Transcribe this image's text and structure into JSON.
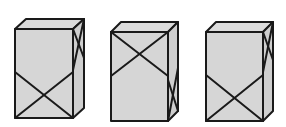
{
  "diagram": {
    "colors": {
      "fill": "#d6d6d6",
      "stroke": "#1a1a1a",
      "background": "#ffffff"
    },
    "boxes": [
      {
        "id": "box-1",
        "front": {
          "x1": 15,
          "y1": 29,
          "x2": 73,
          "y2": 118
        },
        "depth": {
          "dx": 11,
          "dy": -10
        },
        "front_cross": {
          "position": "bottom",
          "y_start": 72
        },
        "side_cross": {
          "position": "top",
          "front_y": 70,
          "back_y": 58
        }
      },
      {
        "id": "box-2",
        "front": {
          "x1": 111,
          "y1": 32,
          "x2": 168,
          "y2": 121
        },
        "depth": {
          "dx": 10,
          "dy": -10
        },
        "front_cross": {
          "position": "top",
          "y_end": 76
        },
        "side_cross": {
          "position": "bottom",
          "front_y": 80,
          "back_y": 68
        }
      },
      {
        "id": "box-3",
        "front": {
          "x1": 206,
          "y1": 32,
          "x2": 263,
          "y2": 121
        },
        "depth": {
          "dx": 10,
          "dy": -10
        },
        "front_cross": {
          "position": "bottom",
          "y_start": 75
        },
        "side_cross": {
          "position": "top",
          "front_y": 72,
          "back_y": 60
        }
      }
    ]
  }
}
